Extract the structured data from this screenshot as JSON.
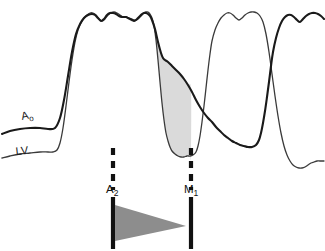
{
  "figure": {
    "type": "medical-pressure-tracing",
    "background_color": "#ffffff",
    "width": 325,
    "height": 251
  },
  "labels": {
    "aortic": {
      "main": "A",
      "sub": "o",
      "full": "Ao"
    },
    "ventricular": {
      "main": "LV",
      "sub": "",
      "full": "LV"
    },
    "timing_a2": {
      "main": "A",
      "sub": "2",
      "full": "A2"
    },
    "timing_m1": {
      "main": "M",
      "sub": "1",
      "full": "M1"
    }
  },
  "colors": {
    "ao_curve": "#1a1a1a",
    "lv_curve": "#3a3a3a",
    "shaded_gradient_fill": "#dadada",
    "shaded_gradient_stroke": "#2a2a2a",
    "marker_line": "#111111",
    "wedge_fill": "#8d8d8d",
    "background": "#ffffff"
  },
  "markers": {
    "a2": {
      "x": 113,
      "dashed_top": 148,
      "dashed_bottom": 190,
      "solid_top": 197,
      "solid_bottom": 249,
      "stroke_width": 4.2,
      "dash_pattern": "7 6"
    },
    "m1": {
      "x": 191,
      "dashed_top": 148,
      "dashed_bottom": 190,
      "solid_top": 197,
      "solid_bottom": 249,
      "stroke_width": 4.2,
      "dash_pattern": "7 6"
    }
  },
  "wedge": {
    "description": "decrescendo-shaped gray wedge between A2 and M1",
    "base_x": 115,
    "base_top_y": 205,
    "base_bottom_y": 241,
    "apex_x": 186,
    "apex_y": 226
  },
  "label_positions": {
    "ao": {
      "x": 22,
      "y": 120
    },
    "lv": {
      "x": 16,
      "y": 155
    },
    "a2": {
      "x": 106,
      "y": 193
    },
    "m1": {
      "x": 184,
      "y": 193
    }
  },
  "chart_data": {
    "type": "line",
    "title": "",
    "xlabel": "",
    "ylabel": "",
    "grid": false,
    "legend": "inline-curve-labels",
    "annotations": [
      {
        "label": "A2",
        "meaning": "aortic-component-second-heart-sound",
        "x_px": 113
      },
      {
        "label": "M1",
        "meaning": "mitral-component-first-heart-sound",
        "x_px": 191
      },
      {
        "label": "shaded-area",
        "meaning": "diastolic-pressure-gradient",
        "between": [
          "A2",
          "M1"
        ]
      },
      {
        "label": "wedge",
        "meaning": "decrescendo-murmur-marker",
        "between": [
          "A2",
          "M1"
        ]
      }
    ],
    "series": [
      {
        "name": "Ao",
        "stroke_width": 2.1,
        "points": [
          [
            2,
            134
          ],
          [
            10,
            131
          ],
          [
            20,
            129
          ],
          [
            30,
            128
          ],
          [
            40,
            128
          ],
          [
            48,
            129
          ],
          [
            55,
            128
          ],
          [
            60,
            118
          ],
          [
            64,
            100
          ],
          [
            68,
            76
          ],
          [
            72,
            52
          ],
          [
            76,
            34
          ],
          [
            80,
            24
          ],
          [
            84,
            18
          ],
          [
            88,
            15
          ],
          [
            92,
            14
          ],
          [
            95,
            15
          ],
          [
            98,
            18
          ],
          [
            101,
            21
          ],
          [
            104,
            19
          ],
          [
            107,
            15
          ],
          [
            110,
            13
          ],
          [
            113,
            13
          ],
          [
            116,
            14
          ],
          [
            119,
            16
          ],
          [
            122,
            17
          ],
          [
            124,
            17
          ],
          [
            126,
            17
          ],
          [
            128,
            18
          ],
          [
            130,
            19
          ],
          [
            132,
            20
          ],
          [
            134,
            21
          ],
          [
            136,
            20
          ],
          [
            138,
            18
          ],
          [
            140,
            16
          ],
          [
            142,
            14
          ],
          [
            144,
            13
          ],
          [
            146,
            13
          ],
          [
            148,
            14
          ],
          [
            150,
            16
          ],
          [
            152,
            20
          ],
          [
            155,
            29
          ],
          [
            158,
            42
          ],
          [
            161,
            53
          ],
          [
            163,
            58
          ],
          [
            165,
            60
          ],
          [
            168,
            62
          ],
          [
            172,
            66
          ],
          [
            176,
            70
          ],
          [
            180,
            74
          ],
          [
            184,
            79
          ],
          [
            188,
            85
          ],
          [
            192,
            92
          ],
          [
            196,
            100
          ],
          [
            200,
            107
          ],
          [
            204,
            113
          ],
          [
            208,
            118
          ],
          [
            212,
            122
          ],
          [
            216,
            127
          ],
          [
            220,
            131
          ],
          [
            224,
            135
          ],
          [
            228,
            138
          ],
          [
            232,
            141
          ],
          [
            236,
            143
          ],
          [
            240,
            145
          ],
          [
            244,
            146
          ],
          [
            248,
            147
          ],
          [
            252,
            147
          ],
          [
            256,
            145
          ],
          [
            259,
            140
          ],
          [
            261,
            133
          ],
          [
            263,
            123
          ],
          [
            265,
            111
          ],
          [
            267,
            97
          ],
          [
            269,
            82
          ],
          [
            271,
            66
          ],
          [
            273,
            52
          ],
          [
            276,
            38
          ],
          [
            279,
            28
          ],
          [
            282,
            21
          ],
          [
            285,
            17
          ],
          [
            288,
            15
          ],
          [
            291,
            15
          ],
          [
            294,
            17
          ],
          [
            297,
            20
          ],
          [
            300,
            22
          ],
          [
            303,
            19
          ],
          [
            306,
            16
          ],
          [
            309,
            14
          ],
          [
            312,
            13
          ],
          [
            315,
            13
          ],
          [
            318,
            14
          ],
          [
            321,
            16
          ],
          [
            324,
            19
          ]
        ]
      },
      {
        "name": "LV",
        "stroke_width": 1.3,
        "points": [
          [
            2,
            158
          ],
          [
            10,
            156
          ],
          [
            20,
            154
          ],
          [
            30,
            153
          ],
          [
            40,
            152
          ],
          [
            48,
            152
          ],
          [
            53,
            152
          ],
          [
            57,
            150
          ],
          [
            60,
            143
          ],
          [
            63,
            128
          ],
          [
            66,
            106
          ],
          [
            69,
            82
          ],
          [
            72,
            60
          ],
          [
            75,
            42
          ],
          [
            78,
            30
          ],
          [
            81,
            23
          ],
          [
            84,
            18
          ],
          [
            87,
            15
          ],
          [
            90,
            13
          ],
          [
            93,
            13
          ],
          [
            96,
            15
          ],
          [
            99,
            19
          ],
          [
            102,
            21
          ],
          [
            105,
            19
          ],
          [
            108,
            15
          ],
          [
            111,
            13
          ],
          [
            114,
            12
          ],
          [
            117,
            13
          ],
          [
            120,
            15
          ],
          [
            123,
            17
          ],
          [
            126,
            17
          ],
          [
            129,
            18
          ],
          [
            132,
            19
          ],
          [
            134,
            20
          ],
          [
            136,
            20
          ],
          [
            138,
            19
          ],
          [
            140,
            17
          ],
          [
            142,
            15
          ],
          [
            144,
            13
          ],
          [
            146,
            12
          ],
          [
            148,
            12
          ],
          [
            150,
            14
          ],
          [
            152,
            18
          ],
          [
            154,
            26
          ],
          [
            156,
            40
          ],
          [
            158,
            60
          ],
          [
            160,
            82
          ],
          [
            162,
            103
          ],
          [
            164,
            120
          ],
          [
            166,
            133
          ],
          [
            168,
            141
          ],
          [
            170,
            147
          ],
          [
            172,
            151
          ],
          [
            175,
            154
          ],
          [
            178,
            156
          ],
          [
            181,
            157
          ],
          [
            184,
            157
          ],
          [
            187,
            156
          ],
          [
            190,
            156
          ],
          [
            193,
            155
          ],
          [
            196,
            152
          ],
          [
            198,
            146
          ],
          [
            200,
            136
          ],
          [
            202,
            122
          ],
          [
            204,
            106
          ],
          [
            206,
            88
          ],
          [
            208,
            70
          ],
          [
            210,
            54
          ],
          [
            212,
            41
          ],
          [
            215,
            30
          ],
          [
            218,
            23
          ],
          [
            221,
            18
          ],
          [
            224,
            15
          ],
          [
            227,
            13
          ],
          [
            230,
            13
          ],
          [
            233,
            15
          ],
          [
            236,
            18
          ],
          [
            239,
            20
          ],
          [
            242,
            18
          ],
          [
            245,
            15
          ],
          [
            248,
            13
          ],
          [
            251,
            12
          ],
          [
            254,
            12
          ],
          [
            257,
            13
          ],
          [
            260,
            16
          ],
          [
            263,
            22
          ],
          [
            266,
            34
          ],
          [
            269,
            52
          ],
          [
            272,
            74
          ],
          [
            275,
            96
          ],
          [
            278,
            116
          ],
          [
            281,
            133
          ],
          [
            284,
            146
          ],
          [
            287,
            155
          ],
          [
            290,
            161
          ],
          [
            293,
            165
          ],
          [
            296,
            167
          ],
          [
            299,
            168
          ],
          [
            302,
            168
          ],
          [
            305,
            167
          ],
          [
            308,
            165
          ],
          [
            311,
            163
          ],
          [
            314,
            162
          ],
          [
            317,
            161
          ],
          [
            320,
            161
          ],
          [
            324,
            161
          ]
        ]
      }
    ],
    "shaded_region": {
      "name": "diastolic gradient",
      "fill": "#dadada",
      "upper_boundary_from": "Ao",
      "lower_boundary_from": "LV",
      "x_start_px": 113,
      "x_end_px": 191
    }
  }
}
